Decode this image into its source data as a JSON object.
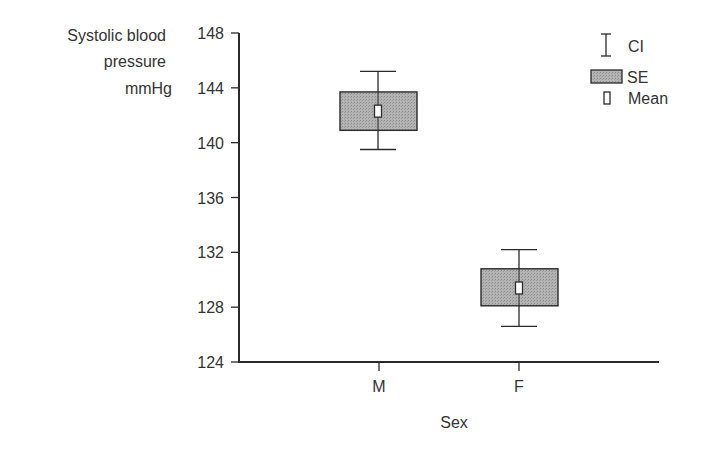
{
  "chart_data": {
    "type": "box",
    "title": "",
    "xlabel": "Sex",
    "ylabel": [
      "Systolic blood",
      "pressure",
      "mmHg"
    ],
    "ylim": [
      124,
      148
    ],
    "yticks": [
      "124",
      "128",
      "132",
      "136",
      "140",
      "144",
      "148"
    ],
    "categories": [
      "M",
      "F"
    ],
    "series": [
      {
        "name": "M",
        "mean": 142.3,
        "se_low": 140.9,
        "se_high": 143.7,
        "ci_low": 139.5,
        "ci_high": 145.2
      },
      {
        "name": "F",
        "mean": 129.4,
        "se_low": 128.1,
        "se_high": 130.8,
        "ci_low": 126.6,
        "ci_high": 132.2
      }
    ],
    "legend": [
      {
        "label": "CI",
        "symbol": "error-bar"
      },
      {
        "label": "SE",
        "symbol": "shaded-box"
      },
      {
        "label": "Mean",
        "symbol": "small-open-rect"
      }
    ],
    "legend_position": "top-right",
    "grid": false
  },
  "colors": {
    "axis": "#2a2a2a",
    "box_fill": "#a9a9a9",
    "text": "#333333"
  }
}
